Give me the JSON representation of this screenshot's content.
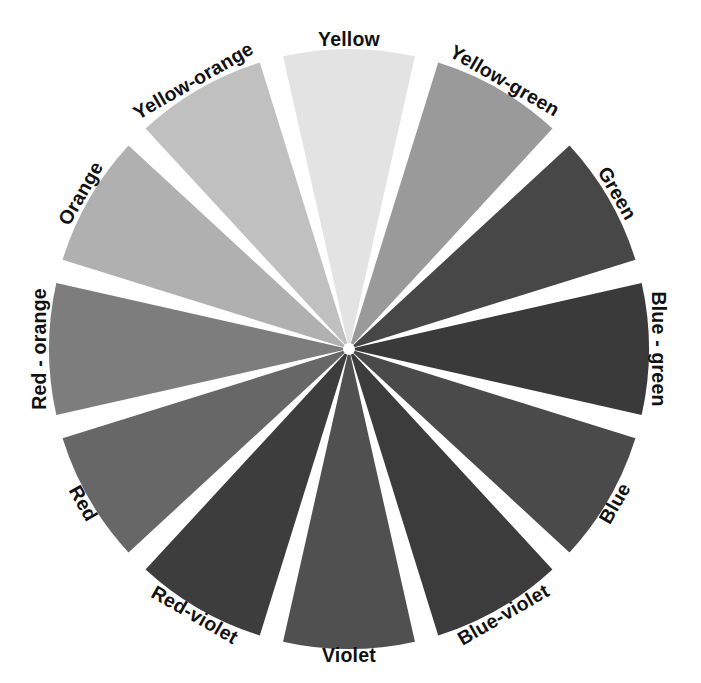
{
  "figure": {
    "type": "color-wheel-diagram",
    "background_color": "#ffffff",
    "gap_color": "#ffffff",
    "center_x": 349,
    "center_y": 349,
    "radius": 300,
    "segment_count": 12,
    "segment_span_degrees": 30,
    "segment_gap_degrees": 4.6
  },
  "chart_data": {
    "type": "pie",
    "categories": [
      "Yellow",
      "Yellow-green",
      "Green",
      "Blue - green",
      "Blue",
      "Blue-violet",
      "Violet",
      "Red-violet",
      "Red",
      "Red - orange",
      "Orange",
      "Yellow-orange"
    ],
    "values": [
      30,
      30,
      30,
      30,
      30,
      30,
      30,
      30,
      30,
      30,
      30,
      30
    ],
    "colors": [
      "#e3e3e3",
      "#9a9a9a",
      "#474747",
      "#3a3a3a",
      "#4a4a4a",
      "#3c3c3c",
      "#505050",
      "#3d3d3d",
      "#676767",
      "#7d7d7d",
      "#b0b0b0",
      "#c0c0c0"
    ],
    "legend": "none",
    "grid": false
  },
  "segments": [
    {
      "id": "yellow",
      "label": "Yellow",
      "color": "#e3e3e3",
      "center_angle_deg": 0,
      "label_rotation_deg": 0,
      "label_x": 349,
      "label_y": 41
    },
    {
      "id": "yellow-green",
      "label": "Yellow-green",
      "color": "#9a9a9a",
      "center_angle_deg": 30,
      "label_rotation_deg": 30,
      "label_x": 504,
      "label_y": 82
    },
    {
      "id": "green",
      "label": "Green",
      "color": "#474747",
      "center_angle_deg": 60,
      "label_rotation_deg": 60,
      "label_x": 616,
      "label_y": 194
    },
    {
      "id": "blue-green",
      "label": "Blue - green",
      "color": "#3a3a3a",
      "center_angle_deg": 90,
      "label_rotation_deg": 90,
      "label_x": 657,
      "label_y": 349
    },
    {
      "id": "blue",
      "label": "Blue",
      "color": "#4a4a4a",
      "center_angle_deg": 120,
      "label_rotation_deg": 120,
      "label_x": 616,
      "label_y": 504
    },
    {
      "id": "blue-violet",
      "label": "Blue-violet",
      "color": "#3c3c3c",
      "center_angle_deg": 150,
      "label_rotation_deg": 150,
      "label_x": 504,
      "label_y": 616
    },
    {
      "id": "violet",
      "label": "Violet",
      "color": "#505050",
      "center_angle_deg": 180,
      "label_rotation_deg": 180,
      "label_x": 349,
      "label_y": 657
    },
    {
      "id": "red-violet",
      "label": "Red-violet",
      "color": "#3d3d3d",
      "center_angle_deg": 210,
      "label_rotation_deg": 210,
      "label_x": 194,
      "label_y": 616
    },
    {
      "id": "red",
      "label": "Red",
      "color": "#676767",
      "center_angle_deg": 240,
      "label_rotation_deg": 240,
      "label_x": 82,
      "label_y": 504
    },
    {
      "id": "red-orange",
      "label": "Red - orange",
      "color": "#7d7d7d",
      "center_angle_deg": 270,
      "label_rotation_deg": 270,
      "label_x": 41,
      "label_y": 349
    },
    {
      "id": "orange",
      "label": "Orange",
      "color": "#b0b0b0",
      "center_angle_deg": 300,
      "label_rotation_deg": 300,
      "label_x": 82,
      "label_y": 194
    },
    {
      "id": "yellow-orange",
      "label": "Yellow-orange",
      "color": "#c0c0c0",
      "center_angle_deg": 330,
      "label_rotation_deg": 330,
      "label_x": 194,
      "label_y": 82
    }
  ]
}
